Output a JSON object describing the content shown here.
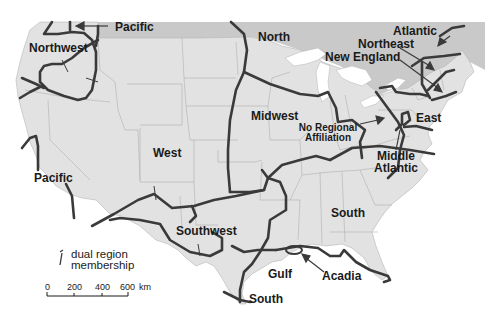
{
  "map": {
    "subject": "Vernacular culture regions of the United States",
    "colors": {
      "land": "#e2e2e2",
      "canada": "#c9c9c9",
      "water": "#ffffff",
      "state_lines": "#a8a8a8",
      "region_lines": "#3a3a3a",
      "label": "#1a1a1a"
    },
    "regions": [
      {
        "name": "Pacific",
        "position": "top",
        "x": 115,
        "y": 20
      },
      {
        "name": "Northwest",
        "x": 29,
        "y": 42
      },
      {
        "name": "North",
        "x": 258,
        "y": 30
      },
      {
        "name": "Atlantic",
        "position": "northeast",
        "x": 393,
        "y": 25
      },
      {
        "name": "Northeast",
        "x": 358,
        "y": 38
      },
      {
        "name": "New England",
        "x": 325,
        "y": 51
      },
      {
        "name": "Midwest",
        "x": 251,
        "y": 110
      },
      {
        "name": "No Regional Affiliation",
        "line1": "No Regional",
        "line2": "Affiliation",
        "x": 298,
        "y": 122
      },
      {
        "name": "East",
        "x": 416,
        "y": 113
      },
      {
        "name": "Middle Atlantic",
        "line1": "Middle",
        "line2": "Atlantic",
        "x": 372,
        "y": 150
      },
      {
        "name": "West",
        "x": 153,
        "y": 148
      },
      {
        "name": "Pacific",
        "position": "southwest",
        "x": 34,
        "y": 173
      },
      {
        "name": "Southwest",
        "x": 176,
        "y": 226
      },
      {
        "name": "South",
        "position": "interior",
        "x": 331,
        "y": 208
      },
      {
        "name": "Gulf",
        "x": 268,
        "y": 268
      },
      {
        "name": "Acadia",
        "x": 322,
        "y": 270
      },
      {
        "name": "South",
        "position": "bottom",
        "x": 249,
        "y": 292
      }
    ],
    "legend": {
      "symbol": "dual region membership marker",
      "line1": "dual region",
      "line2": "membership"
    },
    "scale_bar": {
      "ticks": [
        "0",
        "200",
        "400",
        "600"
      ],
      "unit": "km"
    }
  }
}
